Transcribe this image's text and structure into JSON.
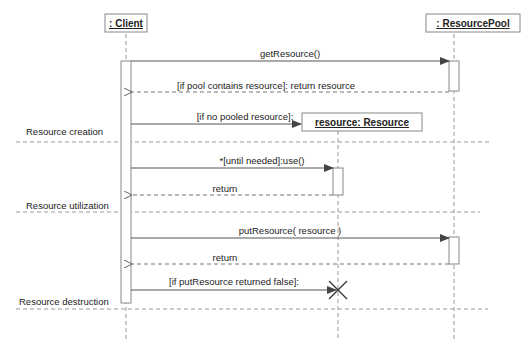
{
  "diagram": {
    "type": "uml-sequence",
    "lifelines": [
      {
        "id": "client",
        "label": ": Client"
      },
      {
        "id": "pool",
        "label": ": ResourcePool"
      },
      {
        "id": "resource",
        "label": "resource: Resource"
      }
    ],
    "messages": [
      {
        "id": "m1",
        "label": "getResource()",
        "from": "client",
        "to": "pool",
        "kind": "sync"
      },
      {
        "id": "m2",
        "label": "[if pool contains resource]:  return resource",
        "from": "pool",
        "to": "client",
        "kind": "return"
      },
      {
        "id": "m3",
        "label": "[if no pooled resource]:",
        "from": "client",
        "to": "resource",
        "kind": "create"
      },
      {
        "id": "m4",
        "label": "*[until needed]:use()",
        "from": "client",
        "to": "resource",
        "kind": "sync"
      },
      {
        "id": "m5",
        "label": "return",
        "from": "resource",
        "to": "client",
        "kind": "return"
      },
      {
        "id": "m6",
        "label": "putResource( resource )",
        "from": "client",
        "to": "pool",
        "kind": "sync"
      },
      {
        "id": "m7",
        "label": "return",
        "from": "pool",
        "to": "client",
        "kind": "return"
      },
      {
        "id": "m8",
        "label": "[if putResource returned false]:",
        "from": "client",
        "to": "resource",
        "kind": "destroy"
      }
    ],
    "phases": [
      {
        "id": "p1",
        "label": "Resource creation"
      },
      {
        "id": "p2",
        "label": "Resource utilization"
      },
      {
        "id": "p3",
        "label": "Resource destruction"
      }
    ],
    "colors": {
      "line": "#555555",
      "dash": "#888888",
      "box_border": "#777777"
    }
  }
}
